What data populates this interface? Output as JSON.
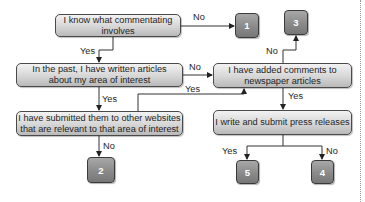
{
  "diagram": {
    "type": "flowchart",
    "nodes": {
      "q1": {
        "text": "I know what commentating involves"
      },
      "q2": {
        "line1": "In the past, I have written articles",
        "line2": "about my area of interest"
      },
      "q3": {
        "line1": "I have submitted them to other websites",
        "line2": "that are relevant to that area of interest"
      },
      "q4": {
        "line1": "I have added comments to",
        "line2": "newspaper articles"
      },
      "q5": {
        "text": "I write and submit press releases"
      },
      "r1": {
        "text": "1"
      },
      "r2": {
        "text": "2"
      },
      "r3": {
        "text": "3"
      },
      "r4": {
        "text": "4"
      },
      "r5": {
        "text": "5"
      }
    },
    "edges": [
      {
        "from": "q1",
        "to": "r1",
        "label": "No"
      },
      {
        "from": "q1",
        "to": "q2",
        "label": "Yes"
      },
      {
        "from": "q2",
        "to": "q4",
        "label": "No"
      },
      {
        "from": "q2",
        "to": "q3",
        "label": "Yes"
      },
      {
        "from": "q3",
        "to": "q4",
        "label": "Yes"
      },
      {
        "from": "q3",
        "to": "r2",
        "label": "No"
      },
      {
        "from": "q4",
        "to": "r3",
        "label": "No"
      },
      {
        "from": "q4",
        "to": "q5",
        "label": "Yes"
      },
      {
        "from": "q5",
        "to": "r5",
        "label": "Yes"
      },
      {
        "from": "q5",
        "to": "r4",
        "label": "No"
      }
    ],
    "colors": {
      "box_fill_top": "#f2f2f2",
      "box_fill_bottom": "#b9b9b9",
      "result_fill": "#8a8a8a",
      "line": "#333333"
    }
  }
}
